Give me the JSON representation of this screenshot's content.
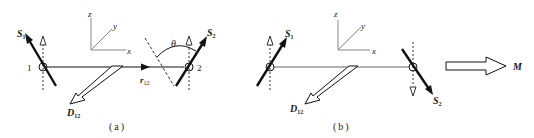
{
  "figure": {
    "panels": [
      {
        "id": "a",
        "caption": "(a)",
        "site1_label": "1",
        "site2_label": "2",
        "spin1_label": "S",
        "spin1_sub": "1",
        "spin2_label": "S",
        "spin2_sub": "2",
        "bond_vector_label": "r",
        "bond_vector_sub": "12",
        "dm_vector_label": "D",
        "dm_vector_sub": "12",
        "angle_label": "θ",
        "axes": {
          "x": "x",
          "y": "y",
          "z": "z"
        }
      },
      {
        "id": "b",
        "caption": "(b)",
        "spin1_label": "S",
        "spin1_sub": "1",
        "spin2_label": "S",
        "spin2_sub": "2",
        "dm_vector_label": "D",
        "dm_vector_sub": "12",
        "result_label": "M",
        "axes": {
          "x": "x",
          "y": "y",
          "z": "z"
        }
      }
    ],
    "colors": {
      "ink": "#111111",
      "axis_gray": "#888888",
      "line_gray": "#555555"
    }
  }
}
